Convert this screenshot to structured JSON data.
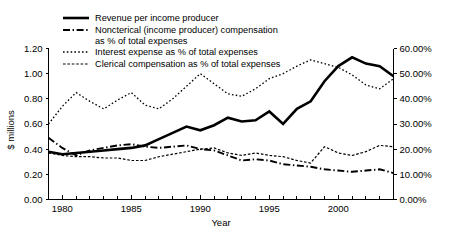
{
  "chart_data": {
    "type": "line",
    "title": "",
    "xlabel": "Year",
    "ylabel": "$ millions",
    "y2label": "",
    "xlim": [
      1979,
      2004
    ],
    "ylim": [
      0.0,
      1.2
    ],
    "y2lim": [
      0.0,
      0.6
    ],
    "grid": false,
    "legend_position": "top-left",
    "x": [
      1979,
      1980,
      1981,
      1982,
      1983,
      1984,
      1985,
      1986,
      1987,
      1988,
      1989,
      1990,
      1991,
      1992,
      1993,
      1994,
      1995,
      1996,
      1997,
      1998,
      1999,
      2000,
      2001,
      2002,
      2003,
      2004
    ],
    "x_ticklabels": [
      "1980",
      "1985",
      "1990",
      "1995",
      "2000"
    ],
    "x_tickvalues": [
      1980,
      1985,
      1990,
      1995,
      2000
    ],
    "y_ticklabels": [
      "0.00",
      "0.20",
      "0.40",
      "0.60",
      "0.80",
      "1.00",
      "1.20"
    ],
    "y_tickvalues": [
      0.0,
      0.2,
      0.4,
      0.6,
      0.8,
      1.0,
      1.2
    ],
    "y2_ticklabels": [
      "0.00%",
      "10.00%",
      "20.00%",
      "30.00%",
      "40.00%",
      "50.00%",
      "60.00%"
    ],
    "y2_tickvalues": [
      0.0,
      0.1,
      0.2,
      0.3,
      0.4,
      0.5,
      0.6
    ],
    "series": [
      {
        "name": "Revenue per income producer",
        "axis": "left",
        "style": "solid",
        "width": 2.6,
        "values": [
          0.38,
          0.36,
          0.37,
          0.38,
          0.39,
          0.4,
          0.41,
          0.43,
          0.48,
          0.53,
          0.58,
          0.55,
          0.59,
          0.65,
          0.62,
          0.63,
          0.7,
          0.6,
          0.72,
          0.78,
          0.94,
          1.06,
          1.13,
          1.08,
          1.06,
          0.98
        ]
      },
      {
        "name": "Noncterical (income producer) compensation as % of total expenses",
        "axis": "right",
        "style": "dashdot",
        "width": 1.9,
        "values": [
          0.245,
          0.205,
          0.175,
          0.195,
          0.205,
          0.215,
          0.22,
          0.21,
          0.205,
          0.21,
          0.215,
          0.2,
          0.195,
          0.175,
          0.155,
          0.16,
          0.155,
          0.14,
          0.135,
          0.13,
          0.12,
          0.115,
          0.11,
          0.115,
          0.12,
          0.105
        ]
      },
      {
        "name": "Interest expense as % of total expenses",
        "axis": "right",
        "style": "dotted",
        "width": 1.3,
        "values": [
          0.3,
          0.37,
          0.425,
          0.39,
          0.36,
          0.395,
          0.425,
          0.375,
          0.36,
          0.4,
          0.45,
          0.5,
          0.46,
          0.42,
          0.41,
          0.44,
          0.48,
          0.5,
          0.53,
          0.555,
          0.54,
          0.525,
          0.495,
          0.455,
          0.44,
          0.48
        ]
      },
      {
        "name": "Clerical compensation as % of total expenses",
        "axis": "right",
        "style": "finedash",
        "width": 1.2,
        "values": [
          0.185,
          0.175,
          0.17,
          0.17,
          0.165,
          0.165,
          0.155,
          0.155,
          0.17,
          0.18,
          0.19,
          0.2,
          0.205,
          0.185,
          0.175,
          0.185,
          0.175,
          0.17,
          0.155,
          0.145,
          0.21,
          0.185,
          0.175,
          0.19,
          0.215,
          0.21
        ]
      }
    ],
    "legend": [
      {
        "label": "Revenue per income producer",
        "style": "solid"
      },
      {
        "label": "Noncterical (income producer) compensation",
        "label2": "as % of total expenses",
        "style": "dashdot"
      },
      {
        "label": "Interest expense as % of total expenses",
        "style": "dotted"
      },
      {
        "label": "Clerical compensation as % of total expenses",
        "style": "finedash"
      }
    ]
  }
}
